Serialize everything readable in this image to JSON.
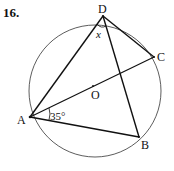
{
  "problem": {
    "number": "16."
  },
  "points": {
    "A": {
      "label": "A",
      "x": 30,
      "y": 117
    },
    "B": {
      "label": "B",
      "x": 139,
      "y": 137
    },
    "C": {
      "label": "C",
      "x": 154,
      "y": 57
    },
    "D": {
      "label": "D",
      "x": 103,
      "y": 16
    },
    "O": {
      "label": "O",
      "x": 93,
      "y": 86
    }
  },
  "circle": {
    "cx": 95,
    "cy": 91,
    "r": 66
  },
  "angles": {
    "x_label": "x",
    "A_label": "35°"
  }
}
